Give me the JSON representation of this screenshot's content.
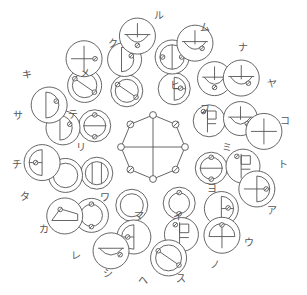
{
  "figure": {
    "background_color": "#ffffff",
    "stroke_color": "#555555",
    "label_color": "#555555",
    "center": {
      "x": 153,
      "y": 147
    }
  },
  "center_motif": {
    "name": "octagon-with-cross",
    "sides": 8,
    "radius": 32,
    "node_count": 8,
    "node_radius": 3.4,
    "has_vertical_axis": true,
    "has_horizontal_axis": true
  },
  "rings": [
    {
      "name": "inner-ring",
      "radius": 62,
      "circle_radius": 16,
      "count": 8
    },
    {
      "name": "middle-ring",
      "radius": 92,
      "circle_radius": 17,
      "count": 12
    },
    {
      "name": "outer-ring",
      "radius": 112,
      "circle_radius": 18,
      "count": 12
    }
  ],
  "labels": [
    {
      "kana": "ル",
      "x": 159,
      "y": 16
    },
    {
      "kana": "ム",
      "x": 205,
      "y": 28
    },
    {
      "kana": "ナ",
      "x": 243,
      "y": 48
    },
    {
      "kana": "ヤ",
      "x": 272,
      "y": 84
    },
    {
      "kana": "コ",
      "x": 285,
      "y": 121
    },
    {
      "kana": "ト",
      "x": 283,
      "y": 165
    },
    {
      "kana": "ア",
      "x": 272,
      "y": 211
    },
    {
      "kana": "ウ",
      "x": 249,
      "y": 243
    },
    {
      "kana": "ノ",
      "x": 215,
      "y": 265
    },
    {
      "kana": "ス",
      "x": 181,
      "y": 279
    },
    {
      "kana": "ヘ",
      "x": 143,
      "y": 281
    },
    {
      "kana": "シ",
      "x": 108,
      "y": 274
    },
    {
      "kana": "レ",
      "x": 76,
      "y": 256
    },
    {
      "kana": "カ",
      "x": 44,
      "y": 230
    },
    {
      "kana": "タ",
      "x": 25,
      "y": 197
    },
    {
      "kana": "チ",
      "x": 17,
      "y": 165
    },
    {
      "kana": "サ",
      "x": 18,
      "y": 116
    },
    {
      "kana": "キ",
      "x": 27,
      "y": 75
    },
    {
      "kana": "メ",
      "x": 85,
      "y": 74
    },
    {
      "kana": "ク",
      "x": 113,
      "y": 44
    },
    {
      "kana": "ヒ",
      "x": 175,
      "y": 86
    },
    {
      "kana": "フ",
      "x": 205,
      "y": 110
    },
    {
      "kana": "ミ",
      "x": 227,
      "y": 148
    },
    {
      "kana": "ヨ",
      "x": 212,
      "y": 189
    },
    {
      "kana": "イ",
      "x": 178,
      "y": 217
    },
    {
      "kana": "マ",
      "x": 139,
      "y": 216
    },
    {
      "kana": "ワ",
      "x": 105,
      "y": 198
    },
    {
      "kana": "リ",
      "x": 81,
      "y": 148
    },
    {
      "kana": "テ",
      "x": 73,
      "y": 115
    }
  ]
}
